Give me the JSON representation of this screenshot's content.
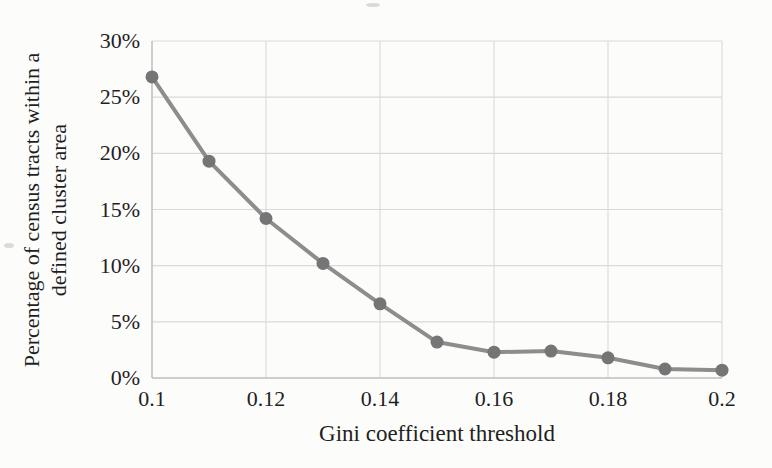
{
  "chart_data": {
    "type": "line",
    "title": "",
    "xlabel": "Gini coefficient threshold",
    "ylabel": "Percentage of census tracts within a defined cluster area",
    "ylabel_lines": [
      "Percentage of census tracts within a",
      "defined cluster area"
    ],
    "x": [
      0.1,
      0.11,
      0.12,
      0.13,
      0.14,
      0.15,
      0.16,
      0.17,
      0.18,
      0.19,
      0.2
    ],
    "series": [
      {
        "name": "Percentage of census tracts within a defined cluster area",
        "values": [
          26.8,
          19.3,
          14.2,
          10.2,
          6.6,
          3.2,
          2.3,
          2.4,
          1.8,
          0.8,
          0.7
        ],
        "marker": "circle"
      }
    ],
    "xlim": [
      0.1,
      0.2
    ],
    "ylim": [
      0,
      30
    ],
    "xticks": {
      "values": [
        0.1,
        0.12,
        0.14,
        0.16,
        0.18,
        0.2
      ],
      "labels": [
        "0.1",
        "0.12",
        "0.14",
        "0.16",
        "0.18",
        "0.2"
      ]
    },
    "yticks": {
      "values": [
        0,
        5,
        10,
        15,
        20,
        25,
        30
      ],
      "labels": [
        "0%",
        "5%",
        "10%",
        "15%",
        "20%",
        "25%",
        "30%"
      ]
    },
    "grid": true,
    "legend": "none",
    "colors": {
      "line": "#8d8d8d",
      "marker": "#757575",
      "grid": "#d9d9d9",
      "axis": "#c3c3c3",
      "text": "#1f1f1f",
      "background": "#fcfcfb"
    }
  }
}
